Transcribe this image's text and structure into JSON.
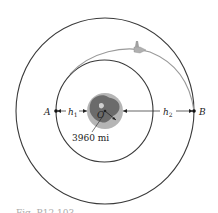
{
  "figure": {
    "points": {
      "a_label": "A",
      "b_label": "B",
      "center_label": "O"
    },
    "dimensions": {
      "h1_label": "h",
      "h1_sub": "1",
      "h2_label": "h",
      "h2_sub": "2",
      "earth_radius": "3960 mi"
    },
    "caption": "Fig. P12.103",
    "colors": {
      "orbit": "#3a3a3a",
      "transfer_orbit": "#9a9a9a",
      "earth_land": "#6b6b6b",
      "earth_sea": "#b5b5b5"
    }
  }
}
